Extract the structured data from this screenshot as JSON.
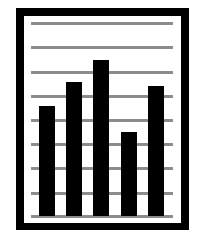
{
  "icon": {
    "name": "bar-chart-document-icon",
    "colors": {
      "frame": "#000000",
      "paper": "#ffffff",
      "grid": "#8c8c8c",
      "bars": "#000000"
    }
  },
  "chart_data": {
    "type": "bar",
    "title": "",
    "xlabel": "",
    "ylabel": "",
    "categories": [
      "1",
      "2",
      "3",
      "4",
      "5"
    ],
    "values": [
      4.6,
      5.6,
      6.5,
      3.5,
      5.4
    ],
    "ylim": [
      0,
      8
    ],
    "grid": true,
    "legend": null
  },
  "layout": {
    "grid_y": [
      22,
      46,
      71,
      95,
      119,
      143,
      167,
      192,
      215
    ],
    "baseline_y": 216,
    "px_per_unit": 24,
    "bar_x": [
      39,
      66,
      93,
      121,
      148
    ]
  }
}
